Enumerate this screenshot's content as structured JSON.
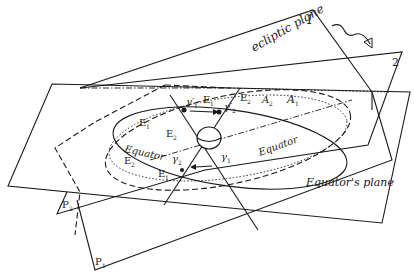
{
  "labels": {
    "ecliptic_plane": "ecliptic plane",
    "plane_1": "1",
    "plane_2": "2",
    "equators_plane": "Equator's plane",
    "equator_left": "Equator",
    "equator_right": "Equator",
    "E1_top": "E",
    "E1_top_sub": "1",
    "E2_top": "E",
    "E2_top_sub": "2",
    "A2": "A",
    "A2_sub": "2",
    "A1": "A",
    "A1_sub": "1",
    "gamma1_top": "γ′",
    "gamma1_top_sub": "1",
    "gamma2_top": "γ′",
    "gamma2_top_sub": "2",
    "E1_left": "E",
    "E1_left_sub": "1",
    "E2_center": "E",
    "E2_center_sub": "2",
    "E2_left": "E",
    "E2_left_sub": "2",
    "E1_bottom": "E",
    "E1_bottom_sub": "1",
    "gamma2_bottom": "γ",
    "gamma2_bottom_sub": "2",
    "gamma1_bottom": "γ",
    "gamma1_bottom_sub": "1",
    "P2": "P",
    "P2_sub": "2",
    "P1": "P",
    "P1_sub": "1"
  },
  "annotations": {
    "rotation_arrow": "wavy-arrow-icon",
    "earth": "earth-globe-icon"
  }
}
